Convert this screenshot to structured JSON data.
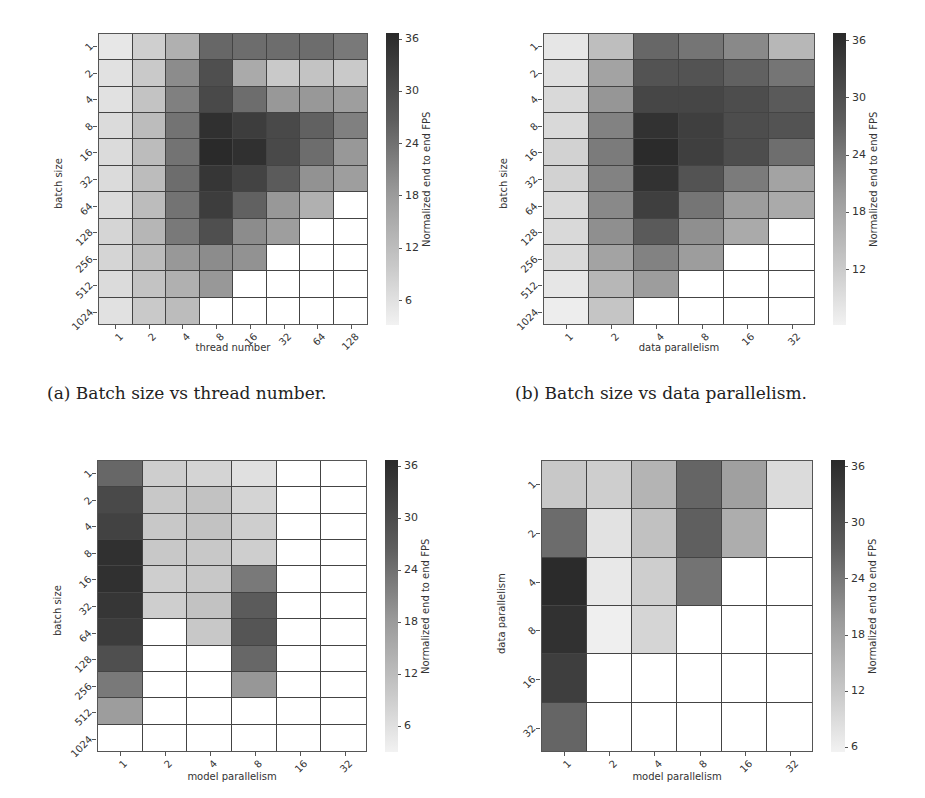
{
  "captions": {
    "a": "(a) Batch size vs thread number.",
    "b": "(b) Batch size vs data parallelism."
  },
  "colorbar_label": "Normalized end to end FPS",
  "chart_data": [
    {
      "id": "a",
      "type": "heatmap",
      "title": "",
      "caption": "(a) Batch size vs thread number.",
      "xlabel": "thread number",
      "ylabel": "batch size",
      "x": [
        "1",
        "2",
        "4",
        "8",
        "16",
        "32",
        "64",
        "128"
      ],
      "y": [
        "1",
        "2",
        "4",
        "8",
        "16",
        "32",
        "64",
        "128",
        "256",
        "512",
        "1024"
      ],
      "colorbar": {
        "label": "Normalized end to end FPS",
        "ticks": [
          6,
          12,
          18,
          24,
          30,
          36
        ],
        "range": [
          3.2,
          36.7
        ]
      },
      "values": [
        [
          5,
          9,
          14,
          26,
          25,
          25,
          25,
          23
        ],
        [
          6,
          10,
          20,
          30,
          15,
          10,
          11,
          10
        ],
        [
          6,
          11,
          22,
          31,
          25,
          18,
          18,
          17
        ],
        [
          7,
          12,
          24,
          35,
          33,
          31,
          27,
          22
        ],
        [
          7,
          12,
          24,
          36,
          35,
          31,
          25,
          18
        ],
        [
          7,
          12,
          25,
          34,
          32,
          28,
          19,
          17
        ],
        [
          7,
          12,
          24,
          33,
          27,
          18,
          14,
          null
        ],
        [
          8,
          13,
          23,
          30,
          20,
          17,
          null,
          null
        ],
        [
          8,
          12,
          18,
          20,
          19,
          null,
          null,
          null
        ],
        [
          7,
          11,
          14,
          18,
          null,
          null,
          null,
          null
        ],
        [
          6,
          10,
          12,
          null,
          null,
          null,
          null,
          null
        ]
      ]
    },
    {
      "id": "b",
      "type": "heatmap",
      "title": "",
      "caption": "(b) Batch size vs data parallelism.",
      "xlabel": "data parallelism",
      "ylabel": "batch size",
      "x": [
        "1",
        "2",
        "4",
        "8",
        "16",
        "32"
      ],
      "y": [
        "1",
        "2",
        "4",
        "8",
        "16",
        "32",
        "64",
        "128",
        "256",
        "512",
        "1024"
      ],
      "colorbar": {
        "label": "Normalized end to end FPS",
        "ticks": [
          12,
          18,
          24,
          30,
          36
        ],
        "range": [
          6.2,
          36.8
        ]
      },
      "values": [
        [
          8,
          14,
          27,
          25,
          22,
          15
        ],
        [
          9,
          18,
          30,
          30,
          28,
          25
        ],
        [
          10,
          20,
          32,
          32,
          31,
          29
        ],
        [
          10,
          23,
          35,
          33,
          31,
          30
        ],
        [
          11,
          24,
          36,
          33,
          31,
          26
        ],
        [
          11,
          23,
          35,
          30,
          24,
          18
        ],
        [
          10,
          22,
          33,
          25,
          19,
          17
        ],
        [
          10,
          21,
          29,
          21,
          17,
          null
        ],
        [
          10,
          18,
          23,
          19,
          null,
          null
        ],
        [
          8,
          15,
          19,
          null,
          null,
          null
        ],
        [
          7,
          13,
          null,
          null,
          null,
          null
        ]
      ]
    },
    {
      "id": "c",
      "type": "heatmap",
      "title": "",
      "caption": "",
      "xlabel": "model parallelism",
      "ylabel": "batch size",
      "x": [
        "1",
        "2",
        "4",
        "8",
        "16",
        "32"
      ],
      "y": [
        "1",
        "2",
        "4",
        "8",
        "16",
        "32",
        "64",
        "128",
        "256",
        "512",
        "1024"
      ],
      "colorbar": {
        "label": "Normalized end to end FPS",
        "ticks": [
          6,
          12,
          18,
          24,
          30,
          36
        ],
        "range": [
          3.0,
          36.7
        ]
      },
      "values": [
        [
          26,
          9,
          8,
          6,
          null,
          null
        ],
        [
          31,
          10,
          11,
          8,
          null,
          null
        ],
        [
          32,
          10,
          11,
          9,
          null,
          null
        ],
        [
          35,
          10,
          10,
          9,
          null,
          null
        ],
        [
          35,
          9,
          10,
          23,
          null,
          null
        ],
        [
          34,
          9,
          11,
          28,
          null,
          null
        ],
        [
          33,
          null,
          10,
          29,
          null,
          null
        ],
        [
          30,
          null,
          null,
          26,
          null,
          null
        ],
        [
          23,
          null,
          null,
          18,
          null,
          null
        ],
        [
          17,
          null,
          null,
          null,
          null,
          null
        ],
        [
          null,
          null,
          null,
          null,
          null,
          null
        ]
      ]
    },
    {
      "id": "d",
      "type": "heatmap",
      "title": "",
      "caption": "",
      "xlabel": "model parallelism",
      "ylabel": "data parallelism",
      "x": [
        "1",
        "2",
        "4",
        "8",
        "16",
        "32"
      ],
      "y": [
        "1",
        "2",
        "4",
        "8",
        "16",
        "32"
      ],
      "colorbar": {
        "label": "Normalized end to end FPS",
        "ticks": [
          6,
          12,
          18,
          24,
          30,
          36
        ],
        "range": [
          5.5,
          36.7
        ]
      },
      "values": [
        [
          12,
          11,
          15,
          27,
          18,
          9
        ],
        [
          26,
          8,
          13,
          28,
          16,
          null
        ],
        [
          36,
          7,
          11,
          25,
          null,
          null
        ],
        [
          35,
          6,
          10,
          null,
          null,
          null
        ],
        [
          33,
          null,
          null,
          null,
          null,
          null
        ],
        [
          27,
          null,
          null,
          null,
          null,
          null
        ]
      ]
    }
  ],
  "layout": [
    {
      "grid": [
        98,
        33,
        270,
        292
      ],
      "cbar": [
        386,
        33,
        13,
        292
      ],
      "xlabel_y": 350,
      "caption_xy": [
        47,
        383
      ]
    },
    {
      "grid": [
        543,
        33,
        272,
        292
      ],
      "cbar": [
        833,
        33,
        13,
        292
      ],
      "xlabel_y": 350,
      "caption_xy": [
        297,
        383
      ]
    },
    {
      "grid": [
        97,
        460,
        270,
        292
      ],
      "cbar": [
        385,
        460,
        13,
        292
      ],
      "xlabel_y": 779,
      "caption_xy": null
    },
    {
      "grid": [
        541,
        460,
        272,
        292
      ],
      "cbar": [
        831,
        460,
        14,
        292
      ],
      "xlabel_y": 779,
      "caption_xy": null
    }
  ]
}
